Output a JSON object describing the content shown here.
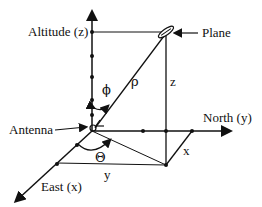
{
  "labels": {
    "altitude": "Altitude (z)",
    "plane": "Plane",
    "north": "North (y)",
    "east": "East (x)",
    "antenna": "Antenna",
    "phi": "ϕ",
    "rho": "ρ",
    "z": "z",
    "theta": "Θ",
    "x": "x",
    "y": "y"
  },
  "colors": {
    "stroke": "#111111",
    "background": "#ffffff"
  }
}
